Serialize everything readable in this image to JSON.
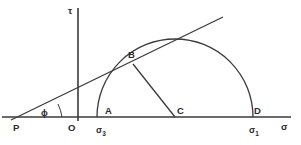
{
  "figure": {
    "colors": {
      "stroke": "#3a3a3a",
      "label": "#2b2b2b",
      "background": "#ffffff"
    },
    "axes": {
      "vertical_label": "τ",
      "horizontal_label": "σ"
    },
    "points": {
      "p": "P",
      "o": "O",
      "a": "A",
      "b": "B",
      "c": "C",
      "d": "D"
    },
    "stress_labels": {
      "sigma3_symbol": "σ",
      "sigma3_sub": "3",
      "sigma1_symbol": "σ",
      "sigma1_sub": "1"
    },
    "angle": {
      "symbol": "ϕ"
    },
    "geometry": {
      "baseline_y": 117,
      "baseline_x_start": 2,
      "baseline_x_end": 291,
      "vertical_axis_x": 78,
      "vertical_axis_y_top": 8,
      "vertical_axis_y_bottom": 121,
      "circle_center_x": 175,
      "circle_center_y": 117,
      "circle_radius": 78,
      "tangent_point_x": 133,
      "tangent_point_y": 64,
      "origin_p_x": 17,
      "origin_p_y": 117,
      "envelope_end_x": 223,
      "envelope_end_y": 17
    }
  }
}
